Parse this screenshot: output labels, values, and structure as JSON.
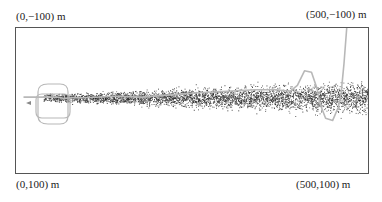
{
  "chart_data": {
    "type": "scatter",
    "title": "",
    "xlabel": "",
    "ylabel": "",
    "units": "m",
    "xlim": [
      0,
      500
    ],
    "ylim": [
      -100,
      100
    ],
    "grid": false,
    "legend": null,
    "corner_labels": {
      "top_left": "(0,−100) m",
      "top_right": "(500,−100) m",
      "bottom_left": "(0,100) m",
      "bottom_right": "(500,100) m"
    },
    "series": [
      {
        "name": "particles",
        "kind": "scatter",
        "color": "#222222",
        "description": "dense point cloud along y≈0, starting near x≈40 and widening toward x=500",
        "x_start": 40,
        "x_end": 500,
        "center_y": -3,
        "half_width_start": 5,
        "half_width_end": 22,
        "count_approx": 4000
      },
      {
        "name": "trajectory",
        "kind": "line",
        "color": "#b8b8b8",
        "description": "gray trajectory with loops near origin, waviness along top of cloud, S-bend near x≈420–460, then exiting upward toward (470,−100)",
        "points": [
          [
            12,
            -4
          ],
          [
            40,
            -4
          ],
          [
            52,
            -4
          ],
          [
            60,
            -4
          ],
          [
            70,
            -2
          ],
          [
            80,
            -3
          ],
          [
            100,
            -3
          ],
          [
            140,
            -5
          ],
          [
            180,
            -4
          ],
          [
            220,
            -7
          ],
          [
            260,
            -10
          ],
          [
            300,
            -12
          ],
          [
            340,
            -14
          ],
          [
            370,
            -14
          ],
          [
            390,
            -12
          ],
          [
            400,
            -20
          ],
          [
            410,
            -40
          ],
          [
            420,
            -38
          ],
          [
            428,
            -15
          ],
          [
            432,
            5
          ],
          [
            440,
            25
          ],
          [
            450,
            28
          ],
          [
            458,
            10
          ],
          [
            462,
            -10
          ],
          [
            466,
            -50
          ],
          [
            470,
            -100
          ]
        ]
      }
    ]
  }
}
